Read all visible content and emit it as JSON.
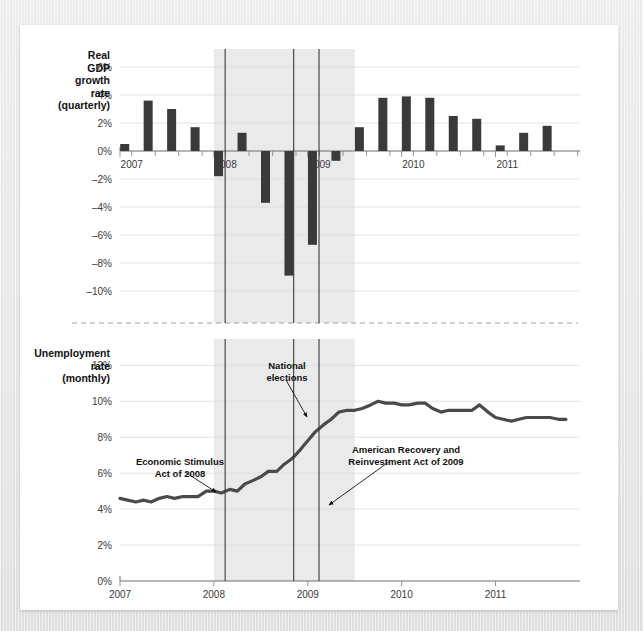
{
  "figure": {
    "background_color": "#e9e9e9",
    "card_color": "#ffffff",
    "bar_color": "#3a3a3a",
    "line_color": "#4a4a4a",
    "band_color": "#eaeaea"
  },
  "panels": {
    "top": {
      "side_label_lines": [
        "Real",
        "GDP",
        "growth",
        "rate",
        "(quarterly)"
      ],
      "y_ticks": [
        "6%",
        "4%",
        "2%",
        "0%",
        "–2%",
        "–4%",
        "–6%",
        "–8%",
        "–10%"
      ],
      "x_ticks": [
        "2007",
        "2008",
        "2009",
        "2010",
        "2011"
      ]
    },
    "bottom": {
      "side_label_lines": [
        "Unemployment",
        "rate",
        "(monthly)"
      ],
      "y_ticks": [
        "12%",
        "10%",
        "8%",
        "6%",
        "4%",
        "2%",
        "0%"
      ],
      "x_ticks": [
        "2007",
        "2008",
        "2009",
        "2010",
        "2011"
      ]
    }
  },
  "annotations": [
    {
      "id": "economic-stimulus",
      "lines": [
        "Economic Stimulus",
        "Act of 2008"
      ]
    },
    {
      "id": "national-elections",
      "lines": [
        "National",
        "elections"
      ]
    },
    {
      "id": "american-recovery",
      "lines": [
        "American Recovery and",
        "Reinvestment Act of 2009"
      ]
    }
  ],
  "chart_data": [
    {
      "type": "bar",
      "title": "Real GDP growth rate (quarterly)",
      "xlabel": "",
      "ylabel": "Real GDP growth rate (quarterly)",
      "ylim": [
        -11,
        7
      ],
      "ytick_values": [
        6,
        4,
        2,
        0,
        -2,
        -4,
        -6,
        -8,
        -10
      ],
      "ytick_labels": [
        "6%",
        "4%",
        "2%",
        "0%",
        "–2%",
        "–4%",
        "–6%",
        "–8%",
        "–10%"
      ],
      "xlim": [
        2007.0,
        2011.9
      ],
      "xtick_values": [
        2007,
        2008,
        2009,
        2010,
        2011
      ],
      "xtick_labels": [
        "2007",
        "2008",
        "2009",
        "2010",
        "2011"
      ],
      "grid": true,
      "legend": "none",
      "categories": [
        "2007 Q1",
        "2007 Q2",
        "2007 Q3",
        "2007 Q4",
        "2008 Q1",
        "2008 Q2",
        "2008 Q3",
        "2008 Q4",
        "2009 Q1",
        "2009 Q2",
        "2009 Q3",
        "2009 Q4",
        "2010 Q1",
        "2010 Q2",
        "2010 Q3",
        "2010 Q4",
        "2011 Q1",
        "2011 Q2",
        "2011 Q3"
      ],
      "x": [
        2007.05,
        2007.3,
        2007.55,
        2007.8,
        2008.05,
        2008.3,
        2008.55,
        2008.8,
        2009.05,
        2009.3,
        2009.55,
        2009.8,
        2010.05,
        2010.3,
        2010.55,
        2010.8,
        2011.05,
        2011.3,
        2011.55
      ],
      "values": [
        0.5,
        3.6,
        3.0,
        1.7,
        -1.8,
        1.3,
        -3.7,
        -8.9,
        -6.7,
        -0.7,
        1.7,
        3.8,
        3.9,
        3.8,
        2.5,
        2.3,
        0.4,
        1.3,
        1.8
      ]
    },
    {
      "type": "line",
      "title": "Unemployment rate (monthly)",
      "xlabel": "",
      "ylabel": "Unemployment rate (monthly)",
      "ylim": [
        0,
        12.8
      ],
      "ytick_values": [
        12,
        10,
        8,
        6,
        4,
        2,
        0
      ],
      "ytick_labels": [
        "12%",
        "10%",
        "8%",
        "6%",
        "4%",
        "2%",
        "0%"
      ],
      "xlim": [
        2007.0,
        2011.9
      ],
      "xtick_values": [
        2007,
        2008,
        2009,
        2010,
        2011
      ],
      "xtick_labels": [
        "2007",
        "2008",
        "2009",
        "2010",
        "2011"
      ],
      "grid": true,
      "legend": "none",
      "x": [
        2007.0,
        2007.08,
        2007.17,
        2007.25,
        2007.33,
        2007.42,
        2007.5,
        2007.58,
        2007.67,
        2007.75,
        2007.83,
        2007.92,
        2008.0,
        2008.08,
        2008.17,
        2008.25,
        2008.33,
        2008.42,
        2008.5,
        2008.58,
        2008.67,
        2008.75,
        2008.83,
        2008.92,
        2009.0,
        2009.08,
        2009.17,
        2009.25,
        2009.33,
        2009.42,
        2009.5,
        2009.58,
        2009.67,
        2009.75,
        2009.83,
        2009.92,
        2010.0,
        2010.08,
        2010.17,
        2010.25,
        2010.33,
        2010.42,
        2010.5,
        2010.58,
        2010.67,
        2010.75,
        2010.83,
        2010.92,
        2011.0,
        2011.08,
        2011.17,
        2011.25,
        2011.33,
        2011.42,
        2011.5,
        2011.58,
        2011.67,
        2011.75
      ],
      "values": [
        4.6,
        4.5,
        4.4,
        4.5,
        4.4,
        4.6,
        4.7,
        4.6,
        4.7,
        4.7,
        4.7,
        5.0,
        5.0,
        4.9,
        5.1,
        5.0,
        5.4,
        5.6,
        5.8,
        6.1,
        6.1,
        6.5,
        6.8,
        7.3,
        7.8,
        8.3,
        8.7,
        9.0,
        9.4,
        9.5,
        9.5,
        9.6,
        9.8,
        10.0,
        9.9,
        9.9,
        9.8,
        9.8,
        9.9,
        9.9,
        9.6,
        9.4,
        9.5,
        9.5,
        9.5,
        9.5,
        9.8,
        9.4,
        9.1,
        9.0,
        8.9,
        9.0,
        9.1,
        9.1,
        9.1,
        9.1,
        9.0,
        9.0
      ]
    }
  ],
  "recession_band": {
    "start": 2008.0,
    "end": 2009.5
  },
  "event_lines": [
    {
      "id": "economic-stimulus-line",
      "x": 2008.12
    },
    {
      "id": "national-elections-line",
      "x": 2008.85
    },
    {
      "id": "american-recovery-line",
      "x": 2009.12
    }
  ]
}
